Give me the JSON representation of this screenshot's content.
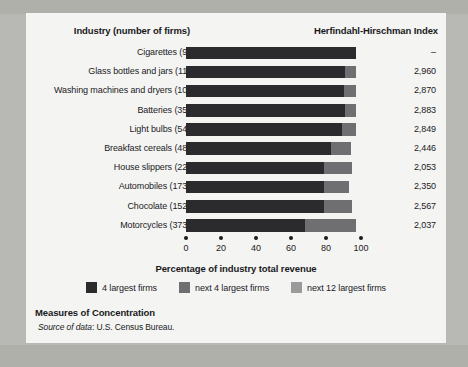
{
  "header": {
    "industry_label": "Industry (number of firms)",
    "index_label": "Herfindahl-Hirschman Index"
  },
  "axis": {
    "title": "Percentage of industry total revenue",
    "ticks": [
      "0",
      "20",
      "40",
      "60",
      "80",
      "100"
    ]
  },
  "legend": [
    {
      "label": "4 largest firms",
      "color": "#2b2b2e"
    },
    {
      "label": "next 4 largest firms",
      "color": "#6f6f71"
    },
    {
      "label": "next 12 largest firms",
      "color": "#9b9b9c"
    }
  ],
  "footer": {
    "title": "Measures of Concentration",
    "source_prefix": "Source of data",
    "source_text": ": U.S. Census Bureau."
  },
  "rows": [
    {
      "label": "Cigarettes  (9)",
      "hhi": "–"
    },
    {
      "label": "Glass bottles and jars  (11)",
      "hhi": "2,960"
    },
    {
      "label": "Washing machines and dryers  (10)",
      "hhi": "2,870"
    },
    {
      "label": "Batteries  (35)",
      "hhi": "2,883"
    },
    {
      "label": "Light bulbs  (54)",
      "hhi": "2,849"
    },
    {
      "label": "Breakfast cereals  (48)",
      "hhi": "2,446"
    },
    {
      "label": "House slippers  (22)",
      "hhi": "2,053"
    },
    {
      "label": "Automobiles  (173)",
      "hhi": "2,350"
    },
    {
      "label": "Chocolate  (152)",
      "hhi": "2,567"
    },
    {
      "label": "Motorcycles  (373)",
      "hhi": "2,037"
    }
  ],
  "chart_data": {
    "type": "bar",
    "orientation": "horizontal",
    "stacked": true,
    "title": "Measures of Concentration",
    "xlabel": "Percentage of industry total revenue",
    "ylabel": "Industry (number of firms)",
    "xlim": [
      0,
      100
    ],
    "xticks": [
      0,
      20,
      40,
      60,
      80,
      100
    ],
    "grid": false,
    "legend_position": "bottom",
    "categories": [
      "Cigarettes (9)",
      "Glass bottles and jars (11)",
      "Washing machines and dryers (10)",
      "Batteries (35)",
      "Light bulbs (54)",
      "Breakfast cereals (48)",
      "House slippers (22)",
      "Automobiles (173)",
      "Chocolate (152)",
      "Motorcycles (373)"
    ],
    "series": [
      {
        "name": "4 largest firms",
        "color": "#2b2b2e",
        "values": [
          97,
          91,
          90,
          91,
          89,
          83,
          79,
          79,
          79,
          68
        ]
      },
      {
        "name": "next 4 largest firms",
        "color": "#6f6f71",
        "values": [
          0,
          6,
          7,
          6,
          8,
          11,
          16,
          14,
          16,
          29
        ]
      },
      {
        "name": "next 12 largest firms",
        "color": "#9b9b9c",
        "values": [
          0,
          0,
          0,
          0,
          0,
          0,
          0,
          0,
          0,
          0
        ]
      }
    ],
    "secondary_axis": {
      "name": "Herfindahl-Hirschman Index",
      "values": [
        null,
        2960,
        2870,
        2883,
        2849,
        2446,
        2053,
        2350,
        2567,
        2037
      ],
      "display": [
        "–",
        "2,960",
        "2,870",
        "2,883",
        "2,849",
        "2,446",
        "2,053",
        "2,350",
        "2,567",
        "2,037"
      ]
    },
    "source": "Source of data: U.S. Census Bureau."
  }
}
